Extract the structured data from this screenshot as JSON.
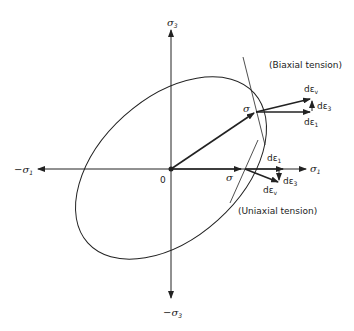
{
  "axes": {
    "x_pos": {
      "symbol": "σ",
      "sub": "1"
    },
    "x_neg": {
      "prefix": "−",
      "symbol": "σ",
      "sub": "1"
    },
    "y_pos": {
      "symbol": "σ",
      "sub": "3"
    },
    "y_neg": {
      "prefix": "−",
      "symbol": "σ",
      "sub": "3"
    },
    "origin": "0"
  },
  "biaxial": {
    "title": "(Biaxial tension)",
    "stress": "σ",
    "de_v": {
      "main": "dε",
      "sub": "v"
    },
    "de_3": {
      "main": "dε",
      "sub": "3"
    },
    "de_1": {
      "main": "dε",
      "sub": "1"
    }
  },
  "uniaxial": {
    "title": "(Uniaxial tension)",
    "stress": "σ",
    "de_1": {
      "main": "dε",
      "sub": "1"
    },
    "de_3": {
      "main": "dε",
      "sub": "3"
    },
    "de_v": {
      "main": "dε",
      "sub": "v"
    }
  },
  "colors": {
    "ink": "#222222",
    "background": "#ffffff"
  }
}
